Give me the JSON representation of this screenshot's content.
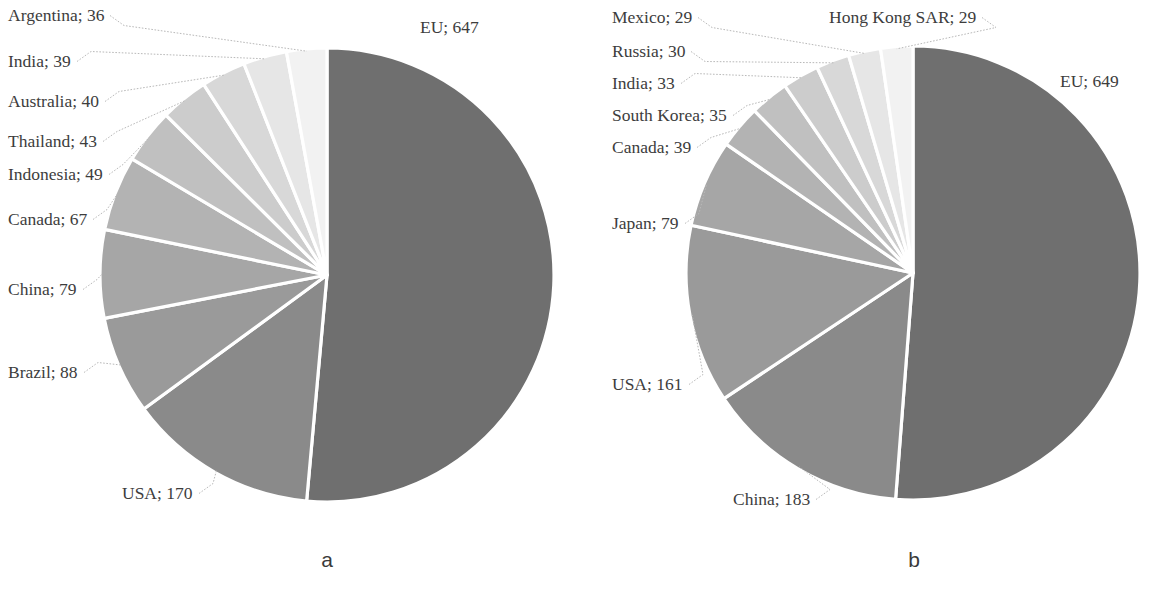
{
  "figure": {
    "panels": [
      {
        "caption": "a",
        "labels": [
          {
            "text": "Argentina; 36",
            "x": 8,
            "y": 6
          },
          {
            "text": "India; 39",
            "x": 8,
            "y": 52
          },
          {
            "text": "Australia; 40",
            "x": 8,
            "y": 92
          },
          {
            "text": "Thailand; 43",
            "x": 8,
            "y": 132
          },
          {
            "text": "Indonesia; 49",
            "x": 8,
            "y": 165
          },
          {
            "text": "Canada; 67",
            "x": 8,
            "y": 210
          },
          {
            "text": "China; 79",
            "x": 8,
            "y": 280
          },
          {
            "text": "Brazil; 88",
            "x": 8,
            "y": 363
          },
          {
            "text": "USA; 170",
            "x": 122,
            "y": 484
          },
          {
            "text": "EU; 647",
            "x": 420,
            "y": 18
          }
        ]
      },
      {
        "caption": "b",
        "labels": [
          {
            "text": "Mexico; 29",
            "x": 612,
            "y": 8
          },
          {
            "text": "Russia; 30",
            "x": 612,
            "y": 42
          },
          {
            "text": "India; 33",
            "x": 612,
            "y": 74
          },
          {
            "text": "South Korea; 35",
            "x": 612,
            "y": 106
          },
          {
            "text": "Canada; 39",
            "x": 612,
            "y": 138
          },
          {
            "text": "Japan; 79",
            "x": 612,
            "y": 214
          },
          {
            "text": "USA; 161",
            "x": 612,
            "y": 375
          },
          {
            "text": "China; 183",
            "x": 733,
            "y": 490
          },
          {
            "text": "Hong Kong SAR; 29",
            "x": 829,
            "y": 8
          },
          {
            "text": "EU; 649",
            "x": 1060,
            "y": 72
          }
        ]
      }
    ]
  },
  "chart_data": [
    {
      "type": "pie",
      "title": "a",
      "panel": "a",
      "categories": [
        "EU",
        "USA",
        "Brazil",
        "China",
        "Canada",
        "Indonesia",
        "Thailand",
        "Australia",
        "India",
        "Argentina"
      ],
      "values": [
        647,
        170,
        88,
        79,
        67,
        49,
        43,
        40,
        39,
        36
      ],
      "total": 1258,
      "label_format": "name; value",
      "start_angle_deg": 0,
      "direction": "clockwise",
      "legend": "none",
      "labels": [
        "EU; 647",
        "USA; 170",
        "Brazil; 88",
        "China; 79",
        "Canada; 67",
        "Indonesia; 49",
        "Thailand; 43",
        "Australia; 40",
        "India; 39",
        "Argentina; 36"
      ],
      "colors": [
        "#6f6f6f",
        "#8a8a8a",
        "#9a9a9a",
        "#a6a6a6",
        "#b3b3b3",
        "#c0c0c0",
        "#cccccc",
        "#d8d8d8",
        "#e6e6e6",
        "#f2f2f2"
      ]
    },
    {
      "type": "pie",
      "title": "b",
      "panel": "b",
      "categories": [
        "EU",
        "China",
        "USA",
        "Japan",
        "Canada",
        "South Korea",
        "India",
        "Russia",
        "Mexico",
        "Hong Kong SAR"
      ],
      "values": [
        649,
        183,
        161,
        79,
        39,
        35,
        33,
        30,
        29,
        29
      ],
      "total": 1267,
      "label_format": "name; value",
      "start_angle_deg": 0,
      "direction": "clockwise",
      "legend": "none",
      "labels": [
        "EU; 649",
        "China; 183",
        "USA; 161",
        "Japan; 79",
        "Canada; 39",
        "South Korea; 35",
        "India; 33",
        "Russia; 30",
        "Mexico; 29",
        "Hong Kong SAR; 29"
      ],
      "colors": [
        "#6f6f6f",
        "#8a8a8a",
        "#9a9a9a",
        "#a6a6a6",
        "#b3b3b3",
        "#c0c0c0",
        "#cccccc",
        "#d8d8d8",
        "#e6e6e6",
        "#f2f2f2"
      ]
    }
  ],
  "geometry": {
    "pie_a": {
      "cx": 327,
      "cy": 275,
      "r": 227
    },
    "pie_b": {
      "cx": 913,
      "cy": 273,
      "r": 227
    }
  }
}
